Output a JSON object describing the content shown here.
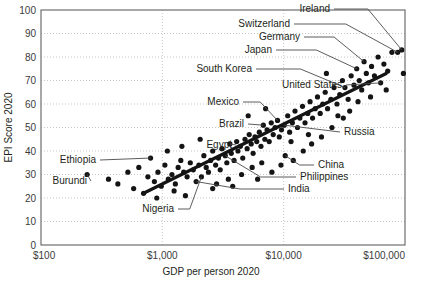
{
  "chart_data": {
    "type": "scatter",
    "title": "",
    "xlabel": "GDP per person 2020",
    "ylabel": "EPI Score 2020",
    "xscale": "log",
    "xlim": [
      100,
      100000
    ],
    "ylim": [
      0,
      100
    ],
    "grid": true,
    "legend": "none",
    "xticks": [
      "$100",
      "$1,000",
      "$10,000",
      "$100,000"
    ],
    "xtick_values": [
      100,
      1000,
      10000,
      100000
    ],
    "yticks": [
      "0",
      "10",
      "20",
      "30",
      "40",
      "50",
      "60",
      "70",
      "80",
      "90",
      "100"
    ],
    "ytick_values": [
      0,
      10,
      20,
      30,
      40,
      50,
      60,
      70,
      80,
      90,
      100
    ],
    "trendline": {
      "x": [
        700,
        70000
      ],
      "y": [
        22,
        73
      ]
    },
    "annotations": [
      {
        "label": "Ireland",
        "x": 94000,
        "y": 83,
        "lx": 330,
        "ly": 12
      },
      {
        "label": "Switzerland",
        "x": 87000,
        "y": 82,
        "lx": 290,
        "ly": 27
      },
      {
        "label": "Germany",
        "x": 46000,
        "y": 78,
        "lx": 300,
        "ly": 40
      },
      {
        "label": "Japan",
        "x": 40000,
        "y": 75,
        "lx": 272,
        "ly": 53
      },
      {
        "label": "South Korea",
        "x": 32000,
        "y": 67,
        "lx": 252,
        "ly": 72
      },
      {
        "label": "United States",
        "x": 63000,
        "y": 69,
        "lx": 342,
        "ly": 88
      },
      {
        "label": "Mexico",
        "x": 8900,
        "y": 53,
        "lx": 239,
        "ly": 105
      },
      {
        "label": "Brazil",
        "x": 6800,
        "y": 51,
        "lx": 244,
        "ly": 127
      },
      {
        "label": "Russia",
        "x": 10100,
        "y": 51,
        "lx": 344,
        "ly": 135
      },
      {
        "label": "Egypt",
        "x": 3600,
        "y": 43,
        "lx": 232,
        "ly": 148
      },
      {
        "label": "Ethiopia",
        "x": 800,
        "y": 37,
        "lx": 96,
        "ly": 163
      },
      {
        "label": "China",
        "x": 10300,
        "y": 38,
        "lx": 318,
        "ly": 168
      },
      {
        "label": "Philippines",
        "x": 3300,
        "y": 38,
        "lx": 300,
        "ly": 180
      },
      {
        "label": "Burundi",
        "x": 240,
        "y": 30,
        "lx": 87,
        "ly": 184
      },
      {
        "label": "India",
        "x": 1900,
        "y": 27,
        "lx": 288,
        "ly": 192
      },
      {
        "label": "Nigeria",
        "x": 2100,
        "y": 29,
        "lx": 174,
        "ly": 212
      }
    ],
    "points": [
      {
        "x": 240,
        "y": 30
      },
      {
        "x": 360,
        "y": 28
      },
      {
        "x": 430,
        "y": 26
      },
      {
        "x": 520,
        "y": 31
      },
      {
        "x": 580,
        "y": 24
      },
      {
        "x": 640,
        "y": 33
      },
      {
        "x": 700,
        "y": 22
      },
      {
        "x": 760,
        "y": 29
      },
      {
        "x": 800,
        "y": 37
      },
      {
        "x": 860,
        "y": 27
      },
      {
        "x": 920,
        "y": 31
      },
      {
        "x": 980,
        "y": 25
      },
      {
        "x": 1050,
        "y": 34
      },
      {
        "x": 1120,
        "y": 28
      },
      {
        "x": 1200,
        "y": 30
      },
      {
        "x": 1280,
        "y": 26
      },
      {
        "x": 1350,
        "y": 33
      },
      {
        "x": 1420,
        "y": 36
      },
      {
        "x": 1500,
        "y": 31
      },
      {
        "x": 1600,
        "y": 29
      },
      {
        "x": 1700,
        "y": 35
      },
      {
        "x": 1800,
        "y": 32
      },
      {
        "x": 1900,
        "y": 27
      },
      {
        "x": 2000,
        "y": 34
      },
      {
        "x": 2100,
        "y": 29
      },
      {
        "x": 2200,
        "y": 38
      },
      {
        "x": 2300,
        "y": 33
      },
      {
        "x": 2400,
        "y": 31
      },
      {
        "x": 2500,
        "y": 36
      },
      {
        "x": 2600,
        "y": 40
      },
      {
        "x": 2750,
        "y": 34
      },
      {
        "x": 2900,
        "y": 37
      },
      {
        "x": 3000,
        "y": 32
      },
      {
        "x": 3100,
        "y": 41
      },
      {
        "x": 3300,
        "y": 38
      },
      {
        "x": 3400,
        "y": 35
      },
      {
        "x": 3600,
        "y": 43
      },
      {
        "x": 3700,
        "y": 39
      },
      {
        "x": 3900,
        "y": 36
      },
      {
        "x": 4100,
        "y": 44
      },
      {
        "x": 4200,
        "y": 40
      },
      {
        "x": 4400,
        "y": 42
      },
      {
        "x": 4600,
        "y": 37
      },
      {
        "x": 4800,
        "y": 45
      },
      {
        "x": 5000,
        "y": 41
      },
      {
        "x": 5200,
        "y": 47
      },
      {
        "x": 5400,
        "y": 43
      },
      {
        "x": 5600,
        "y": 39
      },
      {
        "x": 5800,
        "y": 46
      },
      {
        "x": 6000,
        "y": 44
      },
      {
        "x": 6300,
        "y": 48
      },
      {
        "x": 6500,
        "y": 42
      },
      {
        "x": 6800,
        "y": 51
      },
      {
        "x": 7000,
        "y": 45
      },
      {
        "x": 7300,
        "y": 49
      },
      {
        "x": 7600,
        "y": 44
      },
      {
        "x": 7900,
        "y": 52
      },
      {
        "x": 8200,
        "y": 47
      },
      {
        "x": 8500,
        "y": 50
      },
      {
        "x": 8900,
        "y": 53
      },
      {
        "x": 9200,
        "y": 46
      },
      {
        "x": 9600,
        "y": 49
      },
      {
        "x": 10100,
        "y": 51
      },
      {
        "x": 10300,
        "y": 38
      },
      {
        "x": 10800,
        "y": 55
      },
      {
        "x": 11200,
        "y": 48
      },
      {
        "x": 11800,
        "y": 52
      },
      {
        "x": 12400,
        "y": 57
      },
      {
        "x": 13000,
        "y": 50
      },
      {
        "x": 13600,
        "y": 54
      },
      {
        "x": 14300,
        "y": 59
      },
      {
        "x": 15000,
        "y": 52
      },
      {
        "x": 15800,
        "y": 56
      },
      {
        "x": 16500,
        "y": 61
      },
      {
        "x": 17300,
        "y": 54
      },
      {
        "x": 18200,
        "y": 58
      },
      {
        "x": 19000,
        "y": 63
      },
      {
        "x": 20000,
        "y": 56
      },
      {
        "x": 21000,
        "y": 60
      },
      {
        "x": 22000,
        "y": 65
      },
      {
        "x": 23000,
        "y": 58
      },
      {
        "x": 24500,
        "y": 62
      },
      {
        "x": 26000,
        "y": 67
      },
      {
        "x": 27500,
        "y": 60
      },
      {
        "x": 29000,
        "y": 64
      },
      {
        "x": 30500,
        "y": 70
      },
      {
        "x": 32000,
        "y": 67
      },
      {
        "x": 34000,
        "y": 62
      },
      {
        "x": 36000,
        "y": 72
      },
      {
        "x": 38000,
        "y": 68
      },
      {
        "x": 40000,
        "y": 75
      },
      {
        "x": 42000,
        "y": 70
      },
      {
        "x": 44000,
        "y": 66
      },
      {
        "x": 46000,
        "y": 78
      },
      {
        "x": 48000,
        "y": 73
      },
      {
        "x": 50000,
        "y": 69
      },
      {
        "x": 53000,
        "y": 76
      },
      {
        "x": 56000,
        "y": 72
      },
      {
        "x": 60000,
        "y": 80
      },
      {
        "x": 63000,
        "y": 69
      },
      {
        "x": 67000,
        "y": 77
      },
      {
        "x": 72000,
        "y": 74
      },
      {
        "x": 78000,
        "y": 82
      },
      {
        "x": 87000,
        "y": 82
      },
      {
        "x": 94000,
        "y": 83
      },
      {
        "x": 97000,
        "y": 73
      },
      {
        "x": 2800,
        "y": 26
      },
      {
        "x": 3500,
        "y": 28
      },
      {
        "x": 4500,
        "y": 30
      },
      {
        "x": 5500,
        "y": 33
      },
      {
        "x": 6600,
        "y": 35
      },
      {
        "x": 8000,
        "y": 31
      },
      {
        "x": 9500,
        "y": 34
      },
      {
        "x": 12000,
        "y": 36
      },
      {
        "x": 14500,
        "y": 40
      },
      {
        "x": 17000,
        "y": 43
      },
      {
        "x": 20500,
        "y": 46
      },
      {
        "x": 25000,
        "y": 50
      },
      {
        "x": 31000,
        "y": 54
      },
      {
        "x": 1100,
        "y": 40
      },
      {
        "x": 1450,
        "y": 42
      },
      {
        "x": 2050,
        "y": 45
      },
      {
        "x": 5100,
        "y": 55
      },
      {
        "x": 7100,
        "y": 58
      },
      {
        "x": 11500,
        "y": 44
      },
      {
        "x": 16000,
        "y": 47
      },
      {
        "x": 22500,
        "y": 73
      },
      {
        "x": 28000,
        "y": 55
      },
      {
        "x": 35000,
        "y": 57
      },
      {
        "x": 41000,
        "y": 61
      },
      {
        "x": 52000,
        "y": 63
      },
      {
        "x": 70000,
        "y": 66
      },
      {
        "x": 900,
        "y": 20
      },
      {
        "x": 1250,
        "y": 23
      },
      {
        "x": 1550,
        "y": 21
      },
      {
        "x": 2600,
        "y": 24
      },
      {
        "x": 3800,
        "y": 25
      },
      {
        "x": 6100,
        "y": 28
      }
    ]
  }
}
